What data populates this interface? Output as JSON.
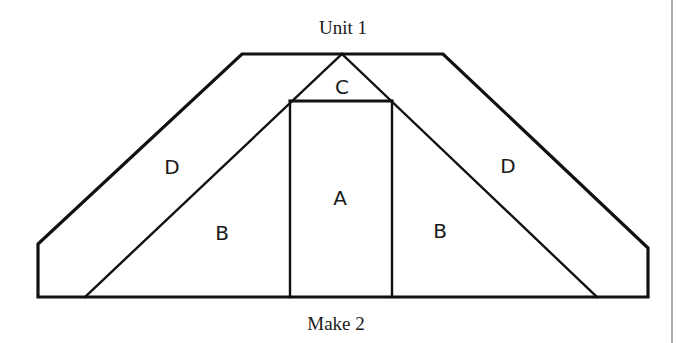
{
  "diagram": {
    "title": "Unit 1",
    "caption": "Make 2",
    "colors": {
      "stroke": "#111111",
      "background": "#ffffff",
      "border": "#777777"
    },
    "pieces": [
      {
        "id": "A",
        "label": "A",
        "shape": "rectangle"
      },
      {
        "id": "B-left",
        "label": "B",
        "shape": "triangle"
      },
      {
        "id": "B-right",
        "label": "B",
        "shape": "triangle"
      },
      {
        "id": "C",
        "label": "C",
        "shape": "triangle"
      },
      {
        "id": "D-left",
        "label": "D",
        "shape": "parallelogram"
      },
      {
        "id": "D-right",
        "label": "D",
        "shape": "parallelogram"
      }
    ]
  }
}
